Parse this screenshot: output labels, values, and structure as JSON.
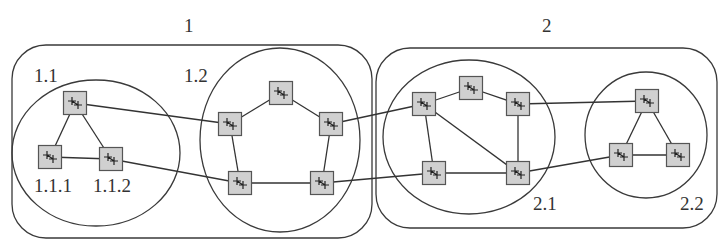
{
  "diagram": {
    "type": "hierarchical network topology",
    "domains": [
      {
        "id": "1",
        "label": "1",
        "box": {
          "x": 12,
          "y": 45,
          "w": 360,
          "h": 193,
          "r": 34
        },
        "label_pos": [
          184,
          32
        ]
      },
      {
        "id": "2",
        "label": "2",
        "box": {
          "x": 376,
          "y": 48,
          "w": 341,
          "h": 180,
          "r": 34
        },
        "label_pos": [
          542,
          32
        ]
      }
    ],
    "subdomains": [
      {
        "id": "1.1",
        "label": "1.1",
        "cx": 96,
        "cy": 153,
        "rx": 84,
        "ry": 73,
        "label_pos": [
          34,
          82
        ]
      },
      {
        "id": "1.2",
        "label": "1.2",
        "cx": 280,
        "cy": 140,
        "rx": 80,
        "ry": 92,
        "label_pos": [
          184,
          82
        ]
      },
      {
        "id": "2.1",
        "label": "2.1",
        "cx": 469,
        "cy": 137,
        "rx": 86,
        "ry": 77,
        "label_pos": [
          533,
          210
        ]
      },
      {
        "id": "2.2",
        "label": "2.2",
        "cx": 646,
        "cy": 135,
        "rx": 61,
        "ry": 63,
        "label_pos": [
          680,
          210
        ]
      }
    ],
    "node_labels": [
      {
        "text": "1.1.1",
        "pos": [
          34,
          192
        ]
      },
      {
        "text": "1.1.2",
        "pos": [
          93,
          192
        ]
      }
    ],
    "nodes": [
      {
        "id": "a",
        "x": 75,
        "y": 103
      },
      {
        "id": "b",
        "x": 50,
        "y": 157
      },
      {
        "id": "c",
        "x": 111,
        "y": 159
      },
      {
        "id": "d",
        "x": 230,
        "y": 124
      },
      {
        "id": "e",
        "x": 281,
        "y": 93
      },
      {
        "id": "f",
        "x": 331,
        "y": 124
      },
      {
        "id": "g",
        "x": 240,
        "y": 183
      },
      {
        "id": "h",
        "x": 322,
        "y": 183
      },
      {
        "id": "i",
        "x": 424,
        "y": 104
      },
      {
        "id": "j",
        "x": 471,
        "y": 88
      },
      {
        "id": "k",
        "x": 518,
        "y": 104
      },
      {
        "id": "l",
        "x": 434,
        "y": 173
      },
      {
        "id": "m",
        "x": 518,
        "y": 173
      },
      {
        "id": "n",
        "x": 647,
        "y": 101
      },
      {
        "id": "o",
        "x": 621,
        "y": 155
      },
      {
        "id": "p",
        "x": 678,
        "y": 155
      }
    ],
    "edges": [
      [
        "a",
        "b"
      ],
      [
        "a",
        "c"
      ],
      [
        "b",
        "c"
      ],
      [
        "a",
        "d"
      ],
      [
        "c",
        "g"
      ],
      [
        "d",
        "e"
      ],
      [
        "e",
        "f"
      ],
      [
        "d",
        "g"
      ],
      [
        "g",
        "h"
      ],
      [
        "f",
        "h"
      ],
      [
        "f",
        "i"
      ],
      [
        "h",
        "l"
      ],
      [
        "i",
        "j"
      ],
      [
        "j",
        "k"
      ],
      [
        "i",
        "l"
      ],
      [
        "i",
        "m"
      ],
      [
        "k",
        "m"
      ],
      [
        "l",
        "m"
      ],
      [
        "k",
        "n"
      ],
      [
        "m",
        "o"
      ],
      [
        "n",
        "o"
      ],
      [
        "n",
        "p"
      ],
      [
        "o",
        "p"
      ]
    ],
    "node_icon": "router-icon",
    "colors": {
      "node_fill": "#d0d0d0",
      "stroke": "#333333",
      "background": "#ffffff"
    }
  }
}
